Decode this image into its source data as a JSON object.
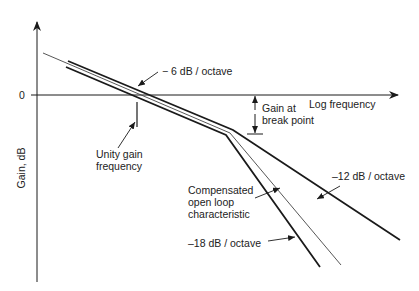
{
  "diagram": {
    "type": "bode-gain-plot",
    "axes": {
      "y_label": "Gain, dB",
      "x_label": "Log frequency",
      "zero_tick": "0"
    },
    "annotations": {
      "slope_6": "− 6 dB / octave",
      "unity_gain_line1": "Unity gain",
      "unity_gain_line2": "frequency",
      "gain_break_line1": "Gain at",
      "gain_break_line2": "break point",
      "compensated_line1": "Compensated",
      "compensated_line2": "open loop",
      "compensated_line3": "characteristic",
      "slope_12": "–12 dB / octave",
      "slope_18": "–18 dB / octave"
    },
    "colors": {
      "line": "#1a1a1a",
      "thin_line": "#444444",
      "background": "#ffffff"
    }
  }
}
